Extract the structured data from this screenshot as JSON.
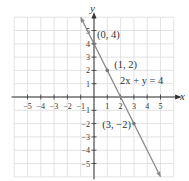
{
  "chart_data": {
    "type": "line",
    "title": "",
    "xlabel": "x",
    "ylabel": "y",
    "xlim": [
      -6,
      6
    ],
    "ylim": [
      -6,
      6
    ],
    "grid": true,
    "x_ticks": [
      -5,
      -4,
      -3,
      -2,
      -1,
      1,
      2,
      3,
      4,
      5
    ],
    "y_ticks": [
      -5,
      -4,
      -3,
      -2,
      -1,
      1,
      2,
      3,
      4,
      5
    ],
    "x_tick_labels": [
      "−5",
      "−4",
      "−3",
      "−2",
      "−1",
      "1",
      "2",
      "3",
      "4",
      "5"
    ],
    "y_tick_labels": [
      "−5",
      "−4",
      "−3",
      "−2",
      "−1",
      "1",
      "2",
      "3",
      "4",
      "5"
    ],
    "series": [
      {
        "name": "2x + y = 4",
        "equation": "2x + y = 4",
        "x": [
          -1,
          5
        ],
        "y": [
          6,
          -6
        ],
        "color": "#888888"
      }
    ],
    "points": [
      {
        "x": 0,
        "y": 4,
        "label": "(0, 4)"
      },
      {
        "x": 1,
        "y": 2,
        "label": "(1, 2)"
      },
      {
        "x": 3,
        "y": -2,
        "label": "(3, −2)"
      }
    ],
    "annotations": [
      {
        "text": "2x + y = 4",
        "x": 2,
        "y": 1
      }
    ]
  },
  "colors": {
    "grid": "#dcdcdc",
    "axis": "#333333",
    "line": "#8a8a8a",
    "point": "#777777"
  }
}
